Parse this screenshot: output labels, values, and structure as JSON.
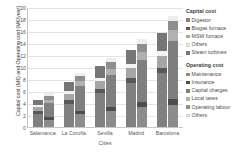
{
  "chart_data": {
    "type": "bar",
    "stacked": true,
    "grouped": true,
    "title": "",
    "xlabel": "Cities",
    "ylabel": "Capital cost (M€) and Operating cost (M€/year)",
    "categories": [
      "Salamanca",
      "La Coruña",
      "Sevilla",
      "Madrid",
      "Barcelona"
    ],
    "ylim": [
      0,
      20
    ],
    "ytick_labels": [
      "0",
      "2",
      "4",
      "6",
      "8",
      "10",
      "12",
      "14",
      "16",
      "18",
      "20"
    ],
    "ytick_values": [
      0,
      2,
      4,
      6,
      8,
      10,
      12,
      14,
      16,
      18,
      20
    ],
    "grid": true,
    "legend_position": "right",
    "bar_groups": [
      {
        "name": "Capital cost",
        "series": [
          {
            "name": "Digestor",
            "color": "#808080",
            "values": [
              2.1,
              3.9,
              5.6,
              7.4,
              9.0
            ]
          },
          {
            "name": "Biogas furnace",
            "color": "#595959",
            "values": [
              0.5,
              0.6,
              0.7,
              0.8,
              0.9
            ]
          },
          {
            "name": "MSW furnace",
            "color": "#a6a6a6",
            "values": [
              0.7,
              1.0,
              1.3,
              1.6,
              1.9
            ]
          },
          {
            "name": "Others",
            "color": "#f2f2f2",
            "values": [
              0.4,
              0.5,
              0.6,
              0.7,
              0.8
            ]
          },
          {
            "name": "Steam turbines",
            "color": "#767676",
            "values": [
              0.8,
              1.5,
              2.0,
              2.3,
              3.0
            ]
          }
        ]
      },
      {
        "name": "Operating cost",
        "series": [
          {
            "name": "Maintenance",
            "color": "#8c8c8c",
            "values": [
              1.2,
              2.1,
              2.7,
              3.4,
              3.7
            ]
          },
          {
            "name": "Insurance",
            "color": "#4d4d4d",
            "values": [
              0.5,
              0.6,
              0.7,
              0.8,
              1.0
            ]
          },
          {
            "name": "Capital charges",
            "color": "#7f7f7f",
            "values": [
              2.3,
              4.1,
              5.3,
              7.0,
              9.6
            ]
          },
          {
            "name": "Local taxes",
            "color": "#b0b0b0",
            "values": [
              0.5,
              0.8,
              1.0,
              1.3,
              1.8
            ]
          },
          {
            "name": "Operating labour",
            "color": "#8f8f8f",
            "values": [
              0.7,
              0.9,
              1.2,
              1.4,
              1.6
            ]
          },
          {
            "name": "Others",
            "color": "#ededed",
            "values": [
              0.4,
              0.5,
              0.6,
              0.7,
              0.8
            ]
          }
        ]
      }
    ],
    "totals": {
      "capital": [
        4.5,
        7.5,
        10.2,
        12.8,
        15.6
      ],
      "operating": [
        5.6,
        9.0,
        11.5,
        14.6,
        18.5
      ]
    }
  },
  "legend": {
    "capital_title": "Capital cost",
    "operating_title": "Operating cost"
  }
}
